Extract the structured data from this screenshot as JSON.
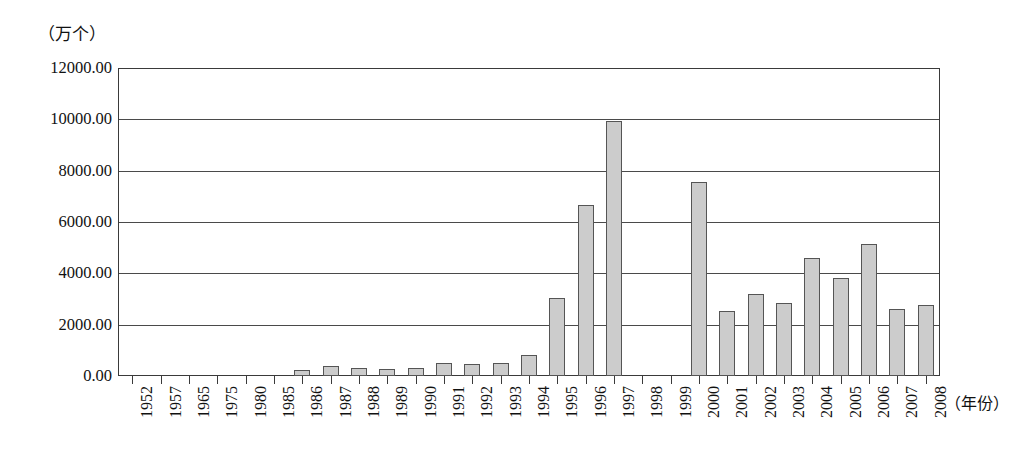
{
  "chart_data": {
    "type": "bar",
    "title": "",
    "subtitle": "",
    "xlabel": "（年份）",
    "ylabel": "（万个）",
    "ylim": [
      0,
      12000
    ],
    "ytick_labels": [
      "0.00",
      "2000.00",
      "4000.00",
      "6000.00",
      "8000.00",
      "10000.00",
      "12000.00"
    ],
    "ytick_values": [
      0,
      2000,
      4000,
      6000,
      8000,
      10000,
      12000
    ],
    "grid": true,
    "legend": null,
    "legend_position": "none",
    "categories": [
      "1952",
      "1957",
      "1965",
      "1975",
      "1980",
      "1985",
      "1986",
      "1987",
      "1988",
      "1989",
      "1990",
      "1991",
      "1992",
      "1993",
      "1994",
      "1995",
      "1996",
      "1997",
      "1998",
      "1999",
      "2000",
      "2001",
      "2002",
      "2003",
      "2004",
      "2005",
      "2006",
      "2007",
      "2008"
    ],
    "values": [
      0,
      0,
      0,
      0,
      0,
      0,
      250,
      400,
      300,
      270,
      320,
      520,
      480,
      520,
      800,
      3030,
      6650,
      9950,
      0,
      0,
      7550,
      2550,
      3190,
      2830,
      4580,
      3830,
      5150,
      2630,
      2760
    ],
    "bar_fill_color": "#cccccc",
    "bar_border_color": "#555555",
    "axis_color": "#3a3a3a",
    "background_color": "#ffffff"
  }
}
